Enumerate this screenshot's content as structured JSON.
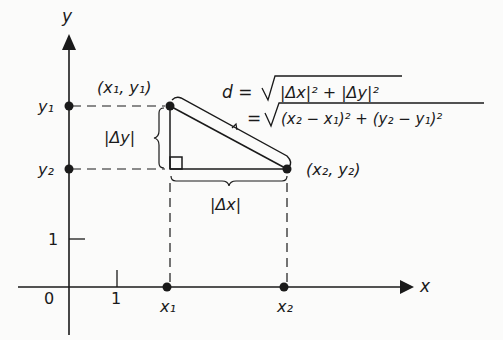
{
  "diagram": {
    "axes": {
      "x_label": "x",
      "y_label": "y",
      "origin_label": "0",
      "x_tick_label": "1",
      "y_tick_label": "1"
    },
    "points": {
      "p1_label": "(x₁, y₁)",
      "p2_label": "(x₂, y₂)",
      "x1_label": "x₁",
      "x2_label": "x₂",
      "y1_label": "y₁",
      "y2_label": "y₂"
    },
    "braces": {
      "delta_y": "|Δy|",
      "delta_x": "|Δx|"
    },
    "formula": {
      "line1_lhs": "d =",
      "line1_rhs": "|Δx|² + |Δy|²",
      "line2_lhs": "=",
      "line2_rhs": "(x₂ − x₁)² + (y₂ − y₁)²"
    },
    "colors": {
      "ink": "#1a1a1a",
      "background": "#fbfbfa"
    }
  }
}
